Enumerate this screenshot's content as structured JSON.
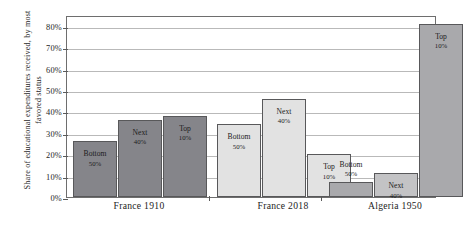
{
  "chart_data": {
    "type": "bar",
    "title": "",
    "xlabel": "",
    "ylabel": "Share of educational expenditures received, by most favored status",
    "ylim": [
      0,
      85
    ],
    "grid": true,
    "legend": "none",
    "ytick_labels": [
      "0%",
      "10%",
      "20%",
      "30%",
      "40%",
      "50%",
      "60%",
      "70%",
      "80%"
    ],
    "ytick_values": [
      0,
      10,
      20,
      30,
      40,
      50,
      60,
      70,
      80
    ],
    "categories": [
      "France 1910",
      "France 2018",
      "Algeria 1950"
    ],
    "series": [
      {
        "name": "Bottom 50%",
        "values": [
          26,
          34,
          7
        ]
      },
      {
        "name": "Next 40%",
        "values": [
          36,
          46,
          11
        ]
      },
      {
        "name": "Top 10%",
        "values": [
          38,
          20,
          81
        ]
      }
    ],
    "bars": [
      {
        "group": "France 1910",
        "label_line1": "Bottom",
        "label_line2": "50%",
        "value": 26,
        "color": "#85858a",
        "label_position": "inside"
      },
      {
        "group": "France 1910",
        "label_line1": "Next",
        "label_line2": "40%",
        "value": 36,
        "color": "#85858a",
        "label_position": "inside"
      },
      {
        "group": "France 1910",
        "label_line1": "Top",
        "label_line2": "10%",
        "value": 38,
        "color": "#85858a",
        "label_position": "inside"
      },
      {
        "group": "France 2018",
        "label_line1": "Bottom",
        "label_line2": "50%",
        "value": 34,
        "color": "#e2e2e2",
        "label_position": "inside"
      },
      {
        "group": "France 2018",
        "label_line1": "Next",
        "label_line2": "40%",
        "value": 46,
        "color": "#e2e2e2",
        "label_position": "inside"
      },
      {
        "group": "France 2018",
        "label_line1": "Top",
        "label_line2": "10%",
        "value": 20,
        "color": "#e2e2e2",
        "label_position": "inside"
      },
      {
        "group": "Algeria 1950",
        "label_line1": "Bottom",
        "label_line2": "50%",
        "value": 7,
        "color": "#a9a9ac",
        "label_position": "outside"
      },
      {
        "group": "Algeria 1950",
        "label_line1": "Next",
        "label_line2": "40%",
        "value": 11,
        "color": "#c3c3c5",
        "label_position": "inside"
      },
      {
        "group": "Algeria 1950",
        "label_line1": "Top",
        "label_line2": "10%",
        "value": 81,
        "color": "#a9a9ac",
        "label_position": "inside"
      }
    ],
    "colors": {
      "france_1910": "#85858a",
      "france_2018": "#e2e2e2",
      "algeria_1950": "#a9a9ac",
      "gridline": "#b9b9b9",
      "axis": "#6e6e6e",
      "text": "#1c1c1c"
    }
  }
}
